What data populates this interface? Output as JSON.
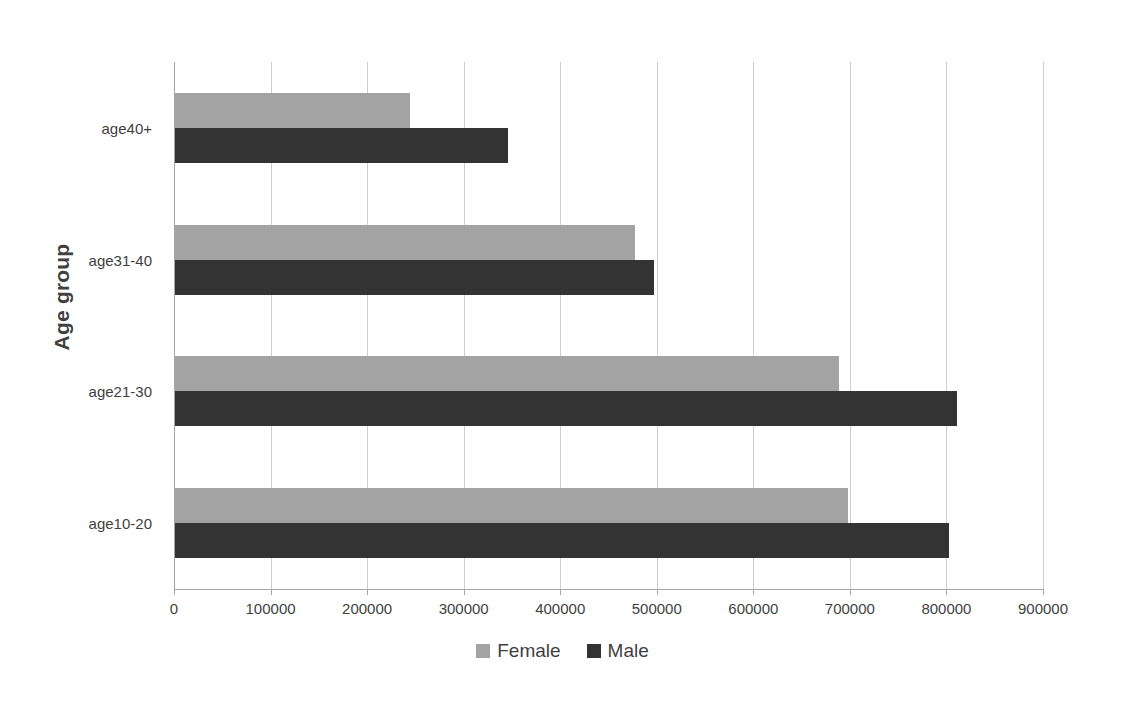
{
  "chart_data": {
    "type": "bar",
    "orientation": "horizontal",
    "title": "",
    "xlabel": "",
    "ylabel": "Age group",
    "categories": [
      "age10-20",
      "age21-30",
      "age31-40",
      "age40+"
    ],
    "series": [
      {
        "name": "Female",
        "color": "#a3a3a3",
        "values": [
          697000,
          688000,
          476000,
          243000
        ]
      },
      {
        "name": "Male",
        "color": "#333333",
        "values": [
          802000,
          810000,
          496000,
          345000
        ]
      }
    ],
    "xlim": [
      0,
      900000
    ],
    "xticks": [
      0,
      100000,
      200000,
      300000,
      400000,
      500000,
      600000,
      700000,
      800000,
      900000
    ],
    "xtick_labels": [
      "0",
      "100000",
      "200000",
      "300000",
      "400000",
      "500000",
      "600000",
      "700000",
      "800000",
      "900000"
    ],
    "grid": "vertical",
    "legend_position": "bottom",
    "legend": [
      "Female",
      "Male"
    ]
  },
  "axes": {
    "y_title": "Age group"
  },
  "legend": {
    "items": [
      {
        "label": "Female",
        "color": "#a3a3a3",
        "swatch_name": "legend-swatch-female"
      },
      {
        "label": "Male",
        "color": "#333333",
        "swatch_name": "legend-swatch-male"
      }
    ]
  },
  "colors": {
    "female": "#a3a3a3",
    "male": "#333333",
    "gridline": "#cfcfcf",
    "axis": "#a6a6a6",
    "text": "#3f3f3f",
    "background": "#ffffff"
  }
}
